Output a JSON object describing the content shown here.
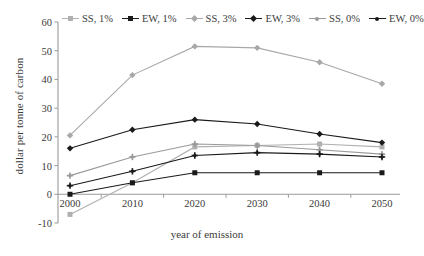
{
  "chart_data": {
    "type": "line",
    "title": "",
    "xlabel": "year of emission",
    "ylabel": "dollar per tonne of carbon",
    "x": [
      2000,
      2010,
      2020,
      2030,
      2040,
      2050
    ],
    "xticklabels": [
      "2000",
      "2010",
      "2020",
      "2030",
      "2040",
      "2050"
    ],
    "yticklabels": [
      "-10",
      "0",
      "10",
      "20",
      "30",
      "40",
      "50",
      "60"
    ],
    "yticks": [
      -10,
      0,
      10,
      20,
      30,
      40,
      50,
      60
    ],
    "xlim": [
      1995,
      2055
    ],
    "ylim": [
      -10,
      60
    ],
    "grid": false,
    "legend_position": "top",
    "series": [
      {
        "name": "SS, 1%",
        "color": "#b0b0b0",
        "marker": "square",
        "values": [
          -7,
          4,
          16.5,
          17,
          17.5,
          16.5
        ]
      },
      {
        "name": "EW, 1%",
        "color": "#1a1a1a",
        "marker": "square",
        "values": [
          0,
          4,
          7.5,
          7.5,
          7.5,
          7.5
        ]
      },
      {
        "name": "SS, 3%",
        "color": "#a8a8a8",
        "marker": "diamond",
        "values": [
          20.5,
          41.5,
          51.5,
          51,
          46,
          38.5
        ]
      },
      {
        "name": "EW, 3%",
        "color": "#1a1a1a",
        "marker": "diamond",
        "values": [
          16,
          22.5,
          26,
          24.5,
          21,
          18
        ]
      },
      {
        "name": "SS, 0%",
        "color": "#9a9a9a",
        "marker": "plus",
        "values": [
          6.5,
          13,
          17.5,
          17,
          15.5,
          14
        ]
      },
      {
        "name": "EW, 0%",
        "color": "#1a1a1a",
        "marker": "plus",
        "values": [
          3,
          8,
          13.5,
          14.5,
          14,
          13
        ]
      }
    ]
  },
  "axis": {
    "y_label": "dollar per tonne of carbon",
    "x_label": "year of emission"
  }
}
